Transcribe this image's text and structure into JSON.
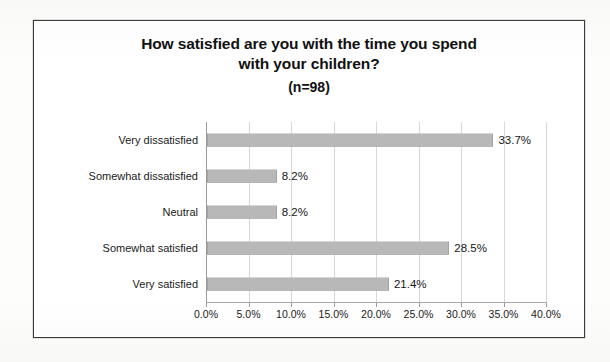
{
  "chart_data": {
    "type": "bar",
    "orientation": "horizontal",
    "title": "How satisfied are you with the time you spend with your children?",
    "title_lines": [
      "How satisfied are you with the time you spend",
      "with your children?"
    ],
    "subtitle": "(n=98)",
    "sample_size": 98,
    "categories": [
      "Very dissatisfied",
      "Somewhat dissatisfied",
      "Neutral",
      "Somewhat satisfied",
      "Very satisfied"
    ],
    "values": [
      33.7,
      8.2,
      8.2,
      28.5,
      21.4
    ],
    "data_labels": [
      "33.7%",
      "8.2%",
      "8.2%",
      "28.5%",
      "21.4%"
    ],
    "xlabel": "",
    "ylabel": "",
    "xlim": [
      0,
      40
    ],
    "xtick_values": [
      0,
      5,
      10,
      15,
      20,
      25,
      30,
      35,
      40
    ],
    "xtick_labels": [
      "0.0%",
      "5.0%",
      "10.0%",
      "15.0%",
      "20.0%",
      "25.0%",
      "30.0%",
      "35.0%",
      "40.0%"
    ],
    "grid": "vertical",
    "legend": "none",
    "bar_color": "#9d9d9d",
    "border_color": "#3b3b3b",
    "text_color": "#161616"
  }
}
